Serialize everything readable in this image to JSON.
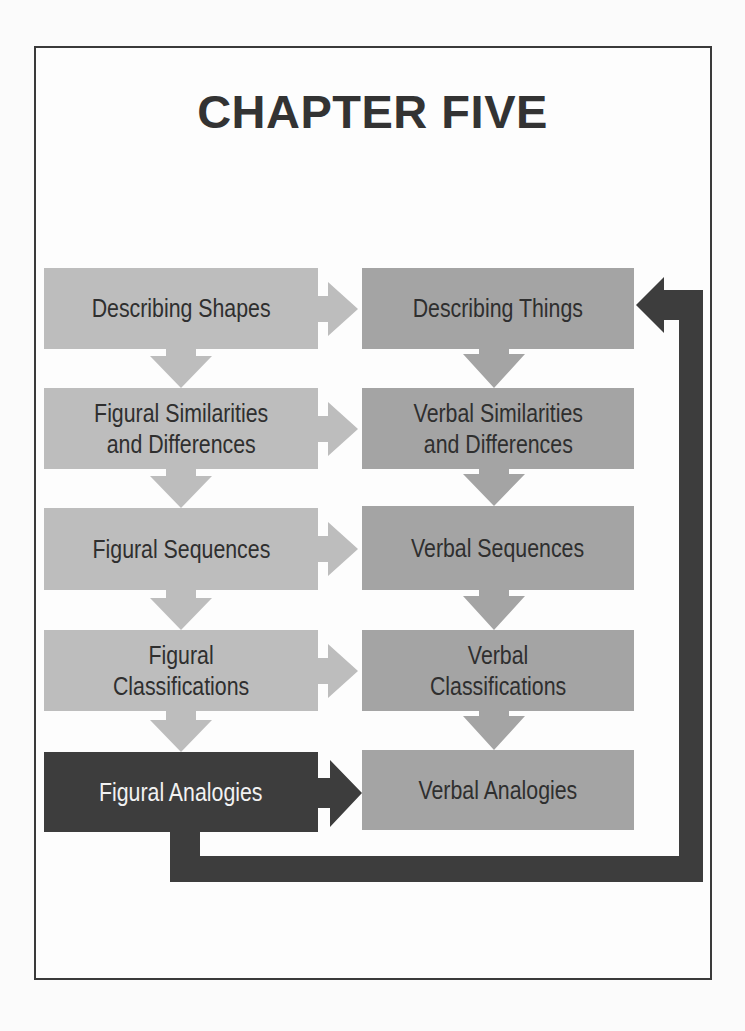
{
  "title": "CHAPTER FIVE",
  "colors": {
    "figural_box": "#bdbdbd",
    "verbal_box": "#a4a4a4",
    "highlight_box": "#3d3d3d",
    "connector_dark": "#3d3d3d",
    "text_dark": "#2f2f2f",
    "text_light": "#f2f2f2"
  },
  "diagram": {
    "left_column": [
      {
        "label": "Describing Shapes"
      },
      {
        "label": "Figural Similarities\nand Differences"
      },
      {
        "label": "Figural Sequences"
      },
      {
        "label": "Figural\nClassifications"
      },
      {
        "label": "Figural Analogies",
        "highlighted": true
      }
    ],
    "right_column": [
      {
        "label": "Describing Things"
      },
      {
        "label": "Verbal Similarities\nand Differences"
      },
      {
        "label": "Verbal Sequences"
      },
      {
        "label": "Verbal\nClassifications"
      },
      {
        "label": "Verbal Analogies"
      }
    ],
    "connectors": [
      {
        "from": "Describing Shapes",
        "to": "Describing Things",
        "type": "arrow-right"
      },
      {
        "from": "Figural Similarities and Differences",
        "to": "Verbal Similarities and Differences",
        "type": "arrow-right"
      },
      {
        "from": "Figural Sequences",
        "to": "Verbal Sequences",
        "type": "arrow-right"
      },
      {
        "from": "Figural Classifications",
        "to": "Verbal Classifications",
        "type": "arrow-right"
      },
      {
        "from": "Figural Analogies",
        "to": "Verbal Analogies",
        "type": "arrow-right-dark"
      },
      {
        "from": "Figural Analogies",
        "to": "Describing Things",
        "type": "feedback-loop-dark"
      }
    ]
  }
}
